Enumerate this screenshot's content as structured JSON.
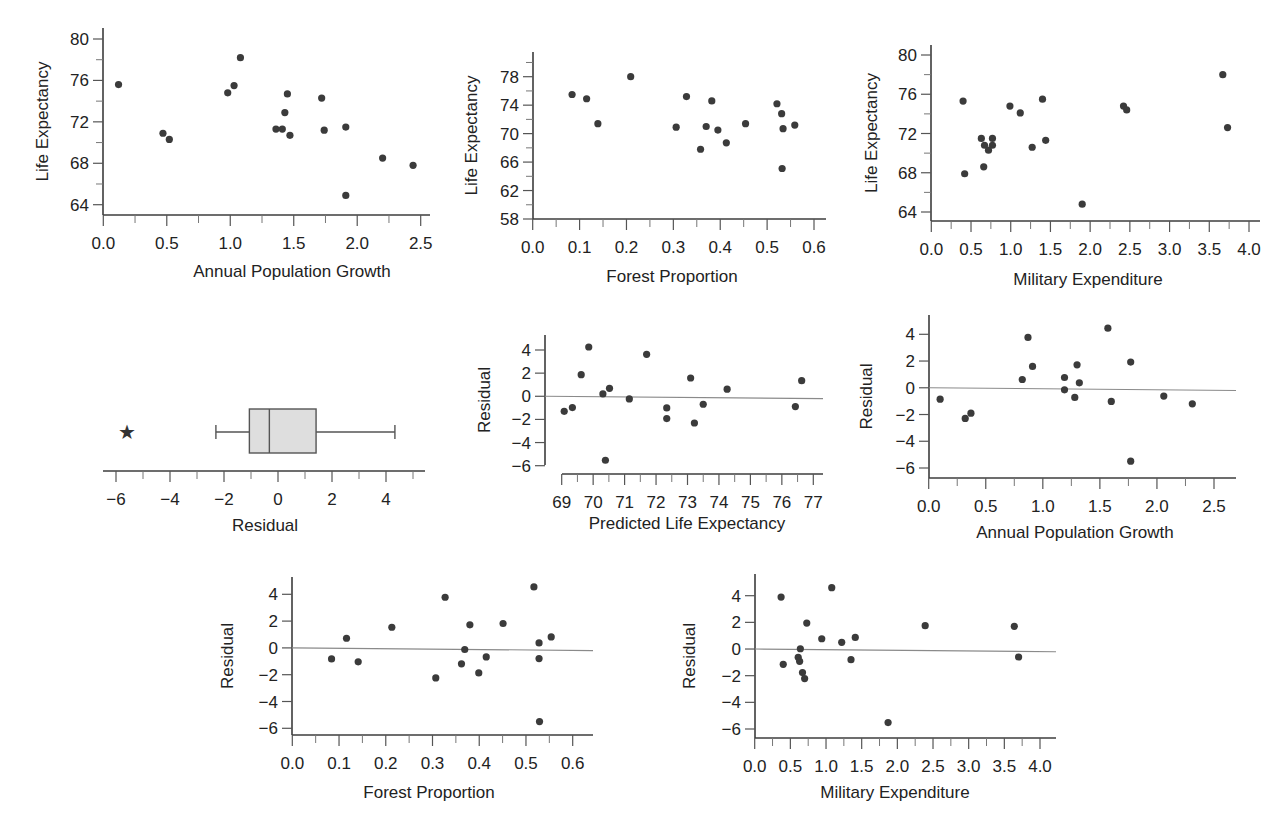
{
  "figure": {
    "width": 1278,
    "height": 825,
    "colors": {
      "points": "#3b3b3b",
      "axis": "#3c3c3c",
      "reference_line": "#8a8a8a",
      "box_fill": "#dedede"
    }
  },
  "chart_data": [
    {
      "id": "le_vs_popgrowth",
      "type": "scatter",
      "title": "",
      "xlabel": "Annual Population Growth",
      "ylabel": "Life Expectancy",
      "xlim": [
        0.0,
        2.55
      ],
      "ylim": [
        63,
        81
      ],
      "xticks": [
        0.0,
        0.5,
        1.0,
        1.5,
        2.0,
        2.5
      ],
      "xtick_labels": [
        "0.0",
        "0.5",
        "1.0",
        "1.5",
        "2.0",
        "2.5"
      ],
      "xminor": [
        0.25,
        0.75,
        1.25,
        1.75,
        2.25
      ],
      "yticks": [
        64,
        68,
        72,
        76,
        80
      ],
      "ytick_labels": [
        "64",
        "68",
        "72",
        "76",
        "80"
      ],
      "yminor": [
        66,
        70,
        74,
        78
      ],
      "reference_line": null,
      "layout": {
        "x0px": 103.3,
        "x1px": 420.7,
        "xv0": 0.0,
        "xv1": 2.5,
        "y0px": 204.7,
        "y1px": 39,
        "yv0": 64,
        "yv1": 80,
        "axis_top": 28,
        "axis_bottom": 215,
        "axis_left": 103,
        "axis_right": 430,
        "ylabel_x": 48,
        "xlabel_y": 277,
        "xlabel_cx": 292
      },
      "points": [
        [
          0.12,
          75.6
        ],
        [
          0.47,
          70.9
        ],
        [
          0.52,
          70.3
        ],
        [
          0.98,
          74.8
        ],
        [
          1.03,
          75.5
        ],
        [
          1.08,
          78.2
        ],
        [
          1.36,
          71.3
        ],
        [
          1.41,
          71.3
        ],
        [
          1.43,
          72.9
        ],
        [
          1.45,
          74.7
        ],
        [
          1.47,
          70.7
        ],
        [
          1.72,
          74.3
        ],
        [
          1.74,
          71.2
        ],
        [
          1.91,
          71.5
        ],
        [
          1.91,
          64.9
        ],
        [
          2.2,
          68.5
        ],
        [
          2.44,
          67.8
        ]
      ]
    },
    {
      "id": "le_vs_forest",
      "type": "scatter",
      "title": "",
      "xlabel": "Forest Proportion",
      "ylabel": "Life Expectancy",
      "xlim": [
        0.0,
        0.63
      ],
      "ylim": [
        58,
        81.5
      ],
      "xticks": [
        0.0,
        0.1,
        0.2,
        0.3,
        0.4,
        0.5,
        0.6
      ],
      "xtick_labels": [
        "0.0",
        "0.1",
        "0.2",
        "0.3",
        "0.4",
        "0.5",
        "0.6"
      ],
      "xminor": [
        0.05,
        0.15,
        0.25,
        0.35,
        0.45,
        0.55
      ],
      "yticks": [
        58,
        62,
        66,
        70,
        74,
        78
      ],
      "ytick_labels": [
        "58",
        "62",
        "66",
        "70",
        "74",
        "78"
      ],
      "yminor": [
        60,
        64,
        68,
        72,
        76,
        80
      ],
      "reference_line": null,
      "layout": {
        "x0px": 532.7,
        "x1px": 814,
        "xv0": 0.0,
        "xv1": 0.6,
        "y0px": 219,
        "y1px": 76.7,
        "yv0": 58,
        "yv1": 78,
        "axis_top": 52,
        "axis_bottom": 219,
        "axis_left": 533,
        "axis_right": 826,
        "ylabel_x": 477,
        "xlabel_y": 282,
        "xlabel_cx": 672
      },
      "points": [
        [
          0.084,
          75.5
        ],
        [
          0.115,
          74.9
        ],
        [
          0.139,
          71.4
        ],
        [
          0.209,
          78.0
        ],
        [
          0.306,
          70.9
        ],
        [
          0.328,
          75.2
        ],
        [
          0.358,
          67.8
        ],
        [
          0.37,
          71.0
        ],
        [
          0.382,
          74.6
        ],
        [
          0.395,
          70.5
        ],
        [
          0.413,
          68.7
        ],
        [
          0.454,
          71.4
        ],
        [
          0.521,
          74.2
        ],
        [
          0.531,
          72.8
        ],
        [
          0.532,
          65.1
        ],
        [
          0.534,
          70.7
        ],
        [
          0.559,
          71.2
        ]
      ]
    },
    {
      "id": "le_vs_military",
      "type": "scatter",
      "title": "",
      "xlabel": "Military Expenditure",
      "ylabel": "Life Expectancy",
      "xlim": [
        0.0,
        4.1
      ],
      "ylim": [
        63,
        80.8
      ],
      "xticks": [
        0.0,
        0.5,
        1.0,
        1.5,
        2.0,
        2.5,
        3.0,
        3.5,
        4.0
      ],
      "xtick_labels": [
        "0.0",
        "0.5",
        "1.0",
        "1.5",
        "2.0",
        "2.5",
        "3.0",
        "3.5",
        "4.0"
      ],
      "xminor": [
        0.25,
        0.75,
        1.25,
        1.75,
        2.25,
        2.75,
        3.25,
        3.75
      ],
      "yticks": [
        64,
        68,
        72,
        76,
        80
      ],
      "ytick_labels": [
        "64",
        "68",
        "72",
        "76",
        "80"
      ],
      "yminor": [
        66,
        70,
        74,
        78
      ],
      "reference_line": null,
      "layout": {
        "x0px": 931.3,
        "x1px": 1249,
        "xv0": 0.0,
        "xv1": 4.0,
        "y0px": 212,
        "y1px": 55,
        "yv0": 64,
        "yv1": 80,
        "axis_top": 45,
        "axis_bottom": 221,
        "axis_left": 931,
        "axis_right": 1260,
        "ylabel_x": 877,
        "xlabel_y": 285,
        "xlabel_cx": 1088
      },
      "points": [
        [
          0.4,
          75.3
        ],
        [
          0.42,
          67.9
        ],
        [
          0.63,
          71.5
        ],
        [
          0.67,
          70.8
        ],
        [
          0.66,
          68.6
        ],
        [
          0.72,
          70.3
        ],
        [
          0.77,
          71.5
        ],
        [
          0.77,
          70.8
        ],
        [
          0.99,
          74.8
        ],
        [
          1.12,
          74.1
        ],
        [
          1.27,
          70.6
        ],
        [
          1.4,
          75.5
        ],
        [
          1.44,
          71.3
        ],
        [
          1.9,
          64.8
        ],
        [
          2.42,
          74.8
        ],
        [
          2.46,
          74.4
        ],
        [
          3.67,
          78.0
        ],
        [
          3.73,
          72.6
        ]
      ]
    },
    {
      "id": "residual_boxplot",
      "type": "boxplot",
      "title": "",
      "xlabel": "Residual",
      "xlim": [
        -6.5,
        5.5
      ],
      "xticks": [
        -6,
        -4,
        -2,
        0,
        2,
        4
      ],
      "xtick_labels": [
        "−6",
        "−4",
        "−2",
        "0",
        "2",
        "4"
      ],
      "xminor": [
        -5,
        -3,
        -1,
        1,
        3,
        5
      ],
      "box": {
        "whisker_low": -2.3,
        "q1": -1.06,
        "median": -0.32,
        "q3": 1.41,
        "whisker_high": 4.33
      },
      "outliers": [
        -5.59
      ],
      "outlier_marker": "★",
      "layout": {
        "x0px": 116,
        "x1px": 386,
        "xv0": -6,
        "xv1": 4,
        "axis_y": 471,
        "axis_left": 103,
        "axis_right": 425,
        "box_top": 409,
        "box_bottom": 453,
        "center_y": 432,
        "xlabel_y": 531,
        "xlabel_cx": 265
      }
    },
    {
      "id": "residual_vs_predicted",
      "type": "scatter",
      "title": "",
      "xlabel": "Predicted Life Expectancy",
      "ylabel": "Residual",
      "xlim": [
        69,
        77.3
      ],
      "ylim": [
        -6.5,
        5.2
      ],
      "xticks": [
        69,
        70,
        71,
        72,
        73,
        74,
        75,
        76,
        77
      ],
      "xtick_labels": [
        "69",
        "70",
        "71",
        "72",
        "73",
        "74",
        "75",
        "76",
        "77"
      ],
      "xminor": [
        69.5,
        70.5,
        71.5,
        72.5,
        73.5,
        74.5,
        75.5,
        76.5
      ],
      "yticks": [
        -6,
        -4,
        -2,
        0,
        2,
        4
      ],
      "ytick_labels": [
        "−6",
        "−4",
        "−2",
        "0",
        "2",
        "4"
      ],
      "yminor": [],
      "reference_line": {
        "y_start": 0,
        "y_end": -0.2
      },
      "layout": {
        "x0px": 561.7,
        "x1px": 813.3,
        "xv0": 69,
        "xv1": 77,
        "y0px": 465.7,
        "y1px": 350,
        "yv0": -6,
        "yv1": 4,
        "axis_top": 335,
        "axis_bottom": 465,
        "axis_left": 545,
        "axis_right": 823,
        "xaxis_y": 474,
        "xaxis_left": 562,
        "ylabel_x": 490,
        "xlabel_y": 529,
        "xlabel_cx": 687
      },
      "points": [
        [
          69.08,
          -1.3
        ],
        [
          69.34,
          -0.98
        ],
        [
          69.62,
          1.87
        ],
        [
          69.86,
          4.26
        ],
        [
          70.31,
          0.2
        ],
        [
          70.39,
          -5.53
        ],
        [
          70.52,
          0.69
        ],
        [
          71.15,
          -0.23
        ],
        [
          71.7,
          3.63
        ],
        [
          72.34,
          -1.01
        ],
        [
          72.34,
          -1.93
        ],
        [
          73.1,
          1.58
        ],
        [
          73.22,
          -2.31
        ],
        [
          73.5,
          -0.69
        ],
        [
          74.26,
          0.61
        ],
        [
          76.43,
          -0.89
        ],
        [
          76.63,
          1.35
        ]
      ]
    },
    {
      "id": "residual_vs_popgrowth",
      "type": "scatter",
      "title": "",
      "xlabel": "Annual Population Growth",
      "ylabel": "Residual",
      "xlim": [
        0.0,
        2.7
      ],
      "ylim": [
        -6.7,
        5.4
      ],
      "xticks": [
        0.0,
        0.5,
        1.0,
        1.5,
        2.0,
        2.5
      ],
      "xtick_labels": [
        "0.0",
        "0.5",
        "1.0",
        "1.5",
        "2.0",
        "2.5"
      ],
      "xminor": [
        0.25,
        0.75,
        1.25,
        1.75,
        2.25
      ],
      "yticks": [
        -6,
        -4,
        -2,
        0,
        2,
        4
      ],
      "ytick_labels": [
        "−6",
        "−4",
        "−2",
        "0",
        "2",
        "4"
      ],
      "yminor": [],
      "reference_line": {
        "y_start": 0,
        "y_end": -0.2
      },
      "layout": {
        "x0px": 928.7,
        "x1px": 1214,
        "xv0": 0.0,
        "xv1": 2.5,
        "y0px": 468,
        "y1px": 334.3,
        "yv0": -6,
        "yv1": 4,
        "axis_top": 315,
        "axis_bottom": 478,
        "axis_left": 929,
        "axis_right": 1236,
        "ylabel_x": 872,
        "xlabel_y": 538,
        "xlabel_cx": 1075
      },
      "points": [
        [
          0.1,
          -0.85
        ],
        [
          0.32,
          -2.29
        ],
        [
          0.37,
          -1.9
        ],
        [
          0.82,
          0.62
        ],
        [
          0.87,
          3.77
        ],
        [
          0.91,
          1.6
        ],
        [
          1.19,
          0.77
        ],
        [
          1.19,
          -0.15
        ],
        [
          1.28,
          -0.72
        ],
        [
          1.3,
          1.72
        ],
        [
          1.32,
          0.37
        ],
        [
          1.57,
          4.46
        ],
        [
          1.6,
          -1.02
        ],
        [
          1.77,
          1.92
        ],
        [
          1.77,
          -5.49
        ],
        [
          2.06,
          -0.62
        ],
        [
          2.31,
          -1.2
        ]
      ]
    },
    {
      "id": "residual_vs_forest",
      "type": "scatter",
      "title": "",
      "xlabel": "Forest Proportion",
      "ylabel": "Residual",
      "xlim": [
        0.0,
        0.64
      ],
      "ylim": [
        -6.5,
        5.4
      ],
      "xticks": [
        0.0,
        0.1,
        0.2,
        0.3,
        0.4,
        0.5,
        0.6
      ],
      "xtick_labels": [
        "0.0",
        "0.1",
        "0.2",
        "0.3",
        "0.4",
        "0.5",
        "0.6"
      ],
      "xminor": [
        0.05,
        0.15,
        0.25,
        0.35,
        0.45,
        0.55
      ],
      "yticks": [
        -6,
        -4,
        -2,
        0,
        2,
        4
      ],
      "ytick_labels": [
        "−6",
        "−4",
        "−2",
        "0",
        "2",
        "4"
      ],
      "yminor": [],
      "reference_line": {
        "y_start": 0,
        "y_end": -0.2
      },
      "layout": {
        "x0px": 292.3,
        "x1px": 572.7,
        "xv0": 0.0,
        "xv1": 0.6,
        "y0px": 728.3,
        "y1px": 594.3,
        "yv0": -6,
        "yv1": 4,
        "axis_top": 577,
        "axis_bottom": 735,
        "axis_left": 292,
        "axis_right": 593,
        "ylabel_x": 233,
        "xlabel_y": 798,
        "xlabel_cx": 429
      },
      "points": [
        [
          0.084,
          -0.82
        ],
        [
          0.116,
          0.72
        ],
        [
          0.141,
          -1.04
        ],
        [
          0.213,
          1.54
        ],
        [
          0.307,
          -2.24
        ],
        [
          0.327,
          3.78
        ],
        [
          0.362,
          -1.19
        ],
        [
          0.369,
          -0.12
        ],
        [
          0.38,
          1.72
        ],
        [
          0.399,
          -1.87
        ],
        [
          0.415,
          -0.67
        ],
        [
          0.451,
          1.82
        ],
        [
          0.517,
          4.55
        ],
        [
          0.528,
          0.37
        ],
        [
          0.528,
          -0.8
        ],
        [
          0.529,
          -5.5
        ],
        [
          0.554,
          0.82
        ]
      ]
    },
    {
      "id": "residual_vs_military",
      "type": "scatter",
      "title": "",
      "xlabel": "Military Expenditure",
      "ylabel": "Residual",
      "xlim": [
        0.0,
        4.2
      ],
      "ylim": [
        -6.6,
        5.6
      ],
      "xticks": [
        0.0,
        0.5,
        1.0,
        1.5,
        2.0,
        2.5,
        3.0,
        3.5,
        4.0
      ],
      "xtick_labels": [
        "0.0",
        "0.5",
        "1.0",
        "1.5",
        "2.0",
        "2.5",
        "3.0",
        "3.5",
        "4.0"
      ],
      "xminor": [
        0.25,
        0.75,
        1.25,
        1.75,
        2.25,
        2.75,
        3.25,
        3.75
      ],
      "yticks": [
        -6,
        -4,
        -2,
        0,
        2,
        4
      ],
      "ytick_labels": [
        "−6",
        "−4",
        "−2",
        "0",
        "2",
        "4"
      ],
      "yminor": [],
      "reference_line": {
        "y_start": 0,
        "y_end": -0.2
      },
      "layout": {
        "x0px": 754.7,
        "x1px": 1040,
        "xv0": 0.0,
        "xv1": 4.0,
        "y0px": 729,
        "y1px": 595.7,
        "yv0": -6,
        "yv1": 4,
        "axis_top": 574,
        "axis_bottom": 738,
        "axis_left": 755,
        "axis_right": 1056,
        "ylabel_x": 695,
        "xlabel_y": 798,
        "xlabel_cx": 895
      },
      "points": [
        [
          0.37,
          3.9
        ],
        [
          0.4,
          -1.15
        ],
        [
          0.61,
          -0.62
        ],
        [
          0.63,
          -0.92
        ],
        [
          0.64,
          0.02
        ],
        [
          0.67,
          -1.77
        ],
        [
          0.7,
          -2.22
        ],
        [
          0.73,
          1.95
        ],
        [
          0.94,
          0.77
        ],
        [
          1.08,
          4.6
        ],
        [
          1.22,
          0.5
        ],
        [
          1.35,
          -0.8
        ],
        [
          1.41,
          0.87
        ],
        [
          1.87,
          -5.52
        ],
        [
          2.39,
          1.75
        ],
        [
          3.64,
          1.7
        ],
        [
          3.7,
          -0.6
        ]
      ]
    }
  ]
}
